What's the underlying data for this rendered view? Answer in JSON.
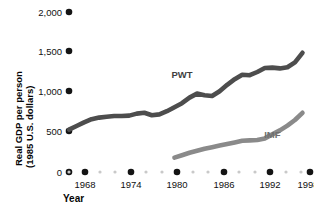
{
  "chart_data": {
    "type": "line",
    "title": "",
    "xlabel": "Year",
    "ylabel": "Real GDP per person (1985 U.S. dollars)",
    "ylabel_line1": "Real GDP per person",
    "ylabel_line2": "(1985 U.S. dollars)",
    "xlim": [
      1966,
      1999
    ],
    "ylim": [
      0,
      2000
    ],
    "grid": false,
    "legend_position": "inline-annotations",
    "ytick_labels": [
      "2,000",
      "1,500",
      "1,000",
      "500",
      "0"
    ],
    "ytick_values": [
      2000,
      1500,
      1000,
      500,
      0
    ],
    "xtick_labels": [
      "1968",
      "1974",
      "1980",
      "1986",
      "1992",
      "1998"
    ],
    "xtick_values": [
      1968,
      1974,
      1980,
      1986,
      1992,
      1998
    ],
    "xtick_minor_values": [
      1966,
      1970,
      1972,
      1976,
      1978,
      1982,
      1984,
      1988,
      1990,
      1994,
      1996
    ],
    "series": [
      {
        "name": "PWT",
        "color": "#4d4d4d",
        "label_x": 1981,
        "label_y": 1180,
        "x": [
          1966,
          1967,
          1968,
          1969,
          1970,
          1971,
          1972,
          1973,
          1974,
          1975,
          1976,
          1977,
          1978,
          1979,
          1980,
          1981,
          1982,
          1983,
          1984,
          1985,
          1986,
          1987,
          1988,
          1989,
          1990,
          1991,
          1992,
          1993,
          1994,
          1995,
          1996,
          1997
        ],
        "values": [
          530,
          575,
          620,
          660,
          680,
          690,
          700,
          700,
          705,
          730,
          740,
          710,
          720,
          760,
          810,
          860,
          930,
          980,
          960,
          950,
          1010,
          1090,
          1160,
          1215,
          1210,
          1250,
          1300,
          1305,
          1295,
          1310,
          1370,
          1490
        ]
      },
      {
        "name": "IMF",
        "color": "#8a8a8a",
        "label_x": 1993,
        "label_y": 430,
        "x": [
          1980,
          1981,
          1982,
          1983,
          1984,
          1985,
          1986,
          1987,
          1988,
          1989,
          1990,
          1991,
          1992,
          1993,
          1994,
          1995,
          1996,
          1997
        ],
        "values": [
          180,
          210,
          240,
          265,
          290,
          310,
          330,
          350,
          370,
          390,
          395,
          400,
          420,
          470,
          520,
          580,
          650,
          740
        ]
      }
    ]
  }
}
